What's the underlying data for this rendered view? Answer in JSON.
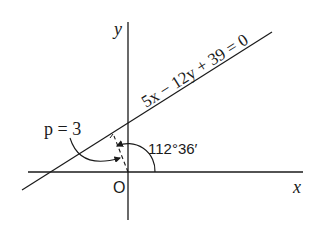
{
  "diagram": {
    "type": "coordinate-geometry",
    "axes": {
      "x_label": "x",
      "y_label": "y",
      "origin_label": "O"
    },
    "line": {
      "equation": "5x − 12y + 39 = 0"
    },
    "perpendicular": {
      "label": "p = 3"
    },
    "angle": {
      "label": "112°36′"
    }
  }
}
